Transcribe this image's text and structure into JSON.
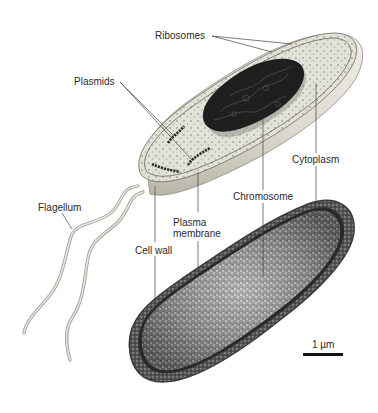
{
  "figure": {
    "labels": {
      "ribosomes": "Ribosomes",
      "plasmids": "Plasmids",
      "cytoplasm": "Cytoplasm",
      "chromosome": "Chromosome",
      "flagellum": "Flagellum",
      "plasma_membrane_line1": "Plasma",
      "plasma_membrane_line2": "membrane",
      "cell_wall": "Cell wall"
    },
    "scale_bar": {
      "label": "1 µm"
    },
    "colors": {
      "background": "#ffffff",
      "cell_body_light": "#e9e7dc",
      "cell_body_shadow": "#c9c6b8",
      "cytoplasm_fill": "#dcdcd0",
      "nucleoid": "#1e1e1e",
      "micrograph_outer": "#5a5a5a",
      "micrograph_inner": "#9a9a9a",
      "leader_line": "#444444",
      "text": "#2a2a2a"
    }
  }
}
